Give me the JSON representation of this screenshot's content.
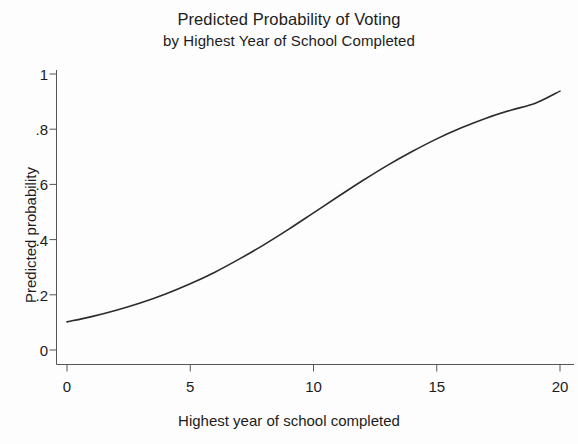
{
  "chart_data": {
    "type": "line",
    "title": "Predicted Probability of Voting",
    "subtitle": "by Highest Year of School Completed",
    "xlabel": "Highest year of school completed",
    "ylabel": "Predicted probability",
    "xlim": [
      0,
      20
    ],
    "ylim": [
      0,
      1
    ],
    "xticks": [
      0,
      5,
      10,
      15,
      20
    ],
    "xticklabels": [
      "0",
      "5",
      "10",
      "15",
      "20"
    ],
    "yticks": [
      0,
      0.2,
      0.4,
      0.6,
      0.8,
      1
    ],
    "yticklabels": [
      "0",
      ".2",
      ".4",
      ".6",
      ".8",
      "1"
    ],
    "grid": false,
    "legend": "none",
    "line_color": "#2b2b2b",
    "line_width": 1.6,
    "series": [
      {
        "name": "Predicted probability of voting",
        "x": [
          0,
          1,
          2,
          3,
          4,
          5,
          6,
          7,
          8,
          9,
          10,
          11,
          12,
          13,
          14,
          15,
          16,
          17,
          18,
          19,
          20
        ],
        "values": [
          0.102,
          0.121,
          0.144,
          0.171,
          0.203,
          0.24,
          0.282,
          0.33,
          0.382,
          0.438,
          0.497,
          0.556,
          0.614,
          0.669,
          0.719,
          0.765,
          0.805,
          0.84,
          0.869,
          0.894,
          0.938
        ]
      }
    ]
  },
  "axes": {
    "x_title": "Highest year of school completed",
    "y_title": "Predicted probability"
  },
  "title": {
    "line1": "Predicted Probability of Voting",
    "line2": "by Highest Year of School Completed"
  }
}
